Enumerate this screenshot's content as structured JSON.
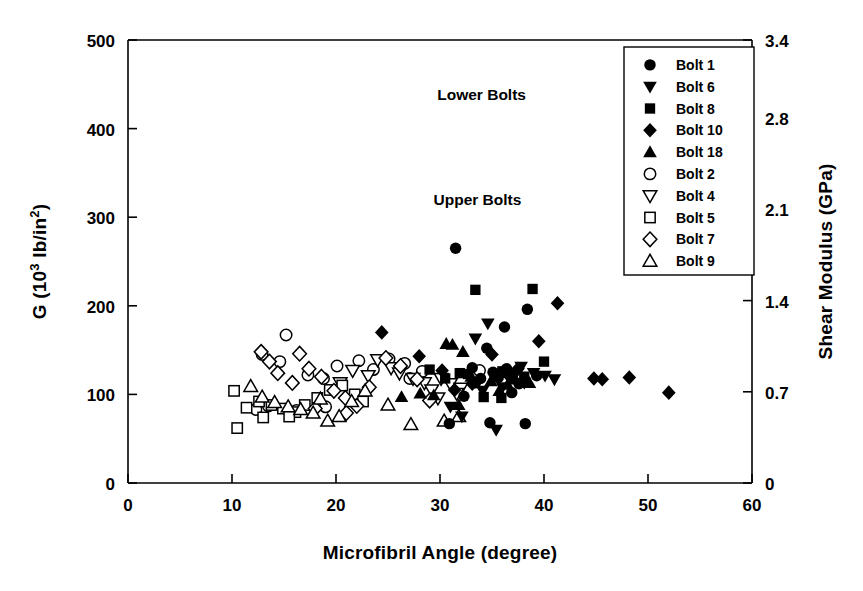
{
  "chart_data": {
    "type": "scatter",
    "title": "",
    "xlabel": "Microfibril Angle (degree)",
    "ylabel": "G (10³ lb/in²)",
    "y2label": "Shear Modulus (GPa)",
    "xlim": [
      0,
      60
    ],
    "ylim": [
      0,
      500
    ],
    "y2lim": [
      0,
      3.4
    ],
    "xticks": [
      "0",
      "10",
      "20",
      "30",
      "40",
      "50",
      "60"
    ],
    "xtick_values": [
      0,
      10,
      20,
      30,
      40,
      50,
      60
    ],
    "yticks": [
      "0",
      "100",
      "200",
      "300",
      "400",
      "500"
    ],
    "ytick_values": [
      0,
      100,
      200,
      300,
      400,
      500
    ],
    "y2ticks": [
      "0",
      "0.7",
      "1.4",
      "2.1",
      "2.8",
      "3.4"
    ],
    "y2tick_values": [
      0,
      0.7,
      1.4,
      2.1,
      2.8,
      3.4
    ],
    "grid": false,
    "legend_position": "top-right",
    "annotations": [
      {
        "text": "Lower Bolts",
        "x": 34.0,
        "y": 432
      },
      {
        "text": "Upper Bolts",
        "x": 33.6,
        "y": 314
      }
    ],
    "series": [
      {
        "name": "Bolt 1",
        "marker": "circle",
        "fill": "solid",
        "group": "Lower Bolts",
        "points": [
          [
            31.5,
            265
          ],
          [
            30.9,
            67
          ],
          [
            33.1,
            130
          ],
          [
            33.9,
            118
          ],
          [
            34.5,
            152
          ],
          [
            35.1,
            125
          ],
          [
            36.2,
            176
          ],
          [
            36.9,
            102
          ],
          [
            37.6,
            112
          ],
          [
            38.4,
            196
          ],
          [
            34.8,
            68
          ],
          [
            38.2,
            67
          ],
          [
            32.3,
            98
          ],
          [
            35.6,
            119
          ],
          [
            39.3,
            121
          ],
          [
            36.4,
            129
          ],
          [
            33.4,
            113
          ]
        ]
      },
      {
        "name": "Bolt 6",
        "marker": "triangle-down",
        "fill": "solid",
        "group": "Lower Bolts",
        "points": [
          [
            33.4,
            163
          ],
          [
            34.6,
            180
          ],
          [
            36.0,
            108
          ],
          [
            37.2,
            122
          ],
          [
            38.1,
            113
          ],
          [
            39.0,
            124
          ],
          [
            40.1,
            121
          ],
          [
            31.0,
            86
          ],
          [
            32.1,
            75
          ],
          [
            35.4,
            60
          ],
          [
            41.0,
            117
          ],
          [
            37.8,
            131
          ],
          [
            34.1,
            104
          ]
        ]
      },
      {
        "name": "Bolt 8",
        "marker": "square",
        "fill": "solid",
        "group": "Lower Bolts",
        "points": [
          [
            33.4,
            218
          ],
          [
            38.9,
            219
          ],
          [
            29.0,
            128
          ],
          [
            31.9,
            124
          ],
          [
            36.0,
            126
          ],
          [
            40.0,
            137
          ],
          [
            34.2,
            97
          ],
          [
            35.9,
            96
          ],
          [
            38.1,
            120
          ],
          [
            30.5,
            118
          ],
          [
            37.0,
            117
          ],
          [
            32.7,
            123
          ]
        ]
      },
      {
        "name": "Bolt 10",
        "marker": "diamond",
        "fill": "solid",
        "group": "Lower Bolts",
        "points": [
          [
            24.4,
            170
          ],
          [
            28.0,
            143
          ],
          [
            30.2,
            127
          ],
          [
            35.0,
            145
          ],
          [
            36.4,
            124
          ],
          [
            39.5,
            160
          ],
          [
            41.3,
            203
          ],
          [
            44.8,
            118
          ],
          [
            45.6,
            117
          ],
          [
            48.2,
            119
          ],
          [
            52.0,
            102
          ],
          [
            33.1,
            112
          ],
          [
            37.5,
            129
          ],
          [
            31.4,
            105
          ]
        ]
      },
      {
        "name": "Bolt 18",
        "marker": "triangle-up",
        "fill": "solid",
        "group": "Lower Bolts",
        "points": [
          [
            30.6,
            157
          ],
          [
            31.2,
            156
          ],
          [
            32.2,
            148
          ],
          [
            26.3,
            97
          ],
          [
            28.1,
            101
          ],
          [
            33.0,
            120
          ],
          [
            34.9,
            115
          ],
          [
            36.5,
            111
          ],
          [
            35.7,
            104
          ],
          [
            31.8,
            88
          ],
          [
            29.4,
            99
          ],
          [
            38.6,
            113
          ]
        ]
      },
      {
        "name": "Bolt 2",
        "marker": "circle",
        "fill": "open",
        "group": "Upper Bolts",
        "points": [
          [
            15.2,
            167
          ],
          [
            12.9,
            145
          ],
          [
            14.6,
            137
          ],
          [
            17.3,
            122
          ],
          [
            18.8,
            118
          ],
          [
            20.1,
            132
          ],
          [
            22.2,
            138
          ],
          [
            23.6,
            128
          ],
          [
            25.1,
            140
          ],
          [
            26.6,
            135
          ],
          [
            28.3,
            126
          ],
          [
            33.8,
            127
          ],
          [
            13.5,
            87
          ],
          [
            16.2,
            82
          ],
          [
            19.0,
            86
          ],
          [
            12.3,
            83
          ],
          [
            27.1,
            118
          ]
        ]
      },
      {
        "name": "Bolt 4",
        "marker": "triangle-down",
        "fill": "open",
        "group": "Upper Bolts",
        "points": [
          [
            24.0,
            139
          ],
          [
            25.3,
            130
          ],
          [
            26.1,
            124
          ],
          [
            27.4,
            118
          ],
          [
            28.5,
            113
          ],
          [
            29.2,
            105
          ],
          [
            30.1,
            118
          ],
          [
            31.0,
            112
          ],
          [
            23.1,
            121
          ],
          [
            21.6,
            127
          ],
          [
            32.0,
            107
          ],
          [
            20.4,
            113
          ],
          [
            29.8,
            96
          ],
          [
            31.6,
            101
          ]
        ]
      },
      {
        "name": "Bolt 5",
        "marker": "square",
        "fill": "open",
        "group": "Upper Bolts",
        "points": [
          [
            10.2,
            104
          ],
          [
            10.5,
            62
          ],
          [
            11.4,
            85
          ],
          [
            12.6,
            92
          ],
          [
            13.8,
            88
          ],
          [
            14.9,
            84
          ],
          [
            16.1,
            80
          ],
          [
            17.0,
            88
          ],
          [
            18.2,
            96
          ],
          [
            19.4,
            105
          ],
          [
            20.6,
            110
          ],
          [
            21.8,
            100
          ],
          [
            15.5,
            75
          ],
          [
            13.0,
            74
          ],
          [
            22.6,
            92
          ]
        ]
      },
      {
        "name": "Bolt 7",
        "marker": "diamond",
        "fill": "open",
        "group": "Upper Bolts",
        "points": [
          [
            12.8,
            148
          ],
          [
            13.6,
            137
          ],
          [
            14.4,
            124
          ],
          [
            16.5,
            146
          ],
          [
            17.4,
            129
          ],
          [
            18.6,
            120
          ],
          [
            15.8,
            113
          ],
          [
            19.8,
            104
          ],
          [
            20.9,
            96
          ],
          [
            22.0,
            87
          ],
          [
            23.2,
            108
          ],
          [
            24.8,
            141
          ],
          [
            26.2,
            132
          ],
          [
            18.0,
            84
          ],
          [
            21.0,
            79
          ],
          [
            27.8,
            117
          ],
          [
            29.0,
            93
          ]
        ]
      },
      {
        "name": "Bolt 9",
        "marker": "triangle-up",
        "fill": "open",
        "group": "Upper Bolts",
        "points": [
          [
            11.8,
            109
          ],
          [
            12.9,
            97
          ],
          [
            14.1,
            91
          ],
          [
            15.4,
            86
          ],
          [
            16.6,
            83
          ],
          [
            17.8,
            79
          ],
          [
            19.2,
            70
          ],
          [
            20.3,
            75
          ],
          [
            21.5,
            92
          ],
          [
            22.8,
            104
          ],
          [
            25.0,
            88
          ],
          [
            27.2,
            66
          ],
          [
            30.4,
            70
          ],
          [
            31.8,
            75
          ],
          [
            18.5,
            95
          ]
        ]
      }
    ]
  },
  "legend": {
    "items": [
      {
        "label": "Bolt 1",
        "marker": "circle",
        "fill": "solid"
      },
      {
        "label": "Bolt 6",
        "marker": "triangle-down",
        "fill": "solid"
      },
      {
        "label": "Bolt 8",
        "marker": "square",
        "fill": "solid"
      },
      {
        "label": "Bolt 10",
        "marker": "diamond",
        "fill": "solid"
      },
      {
        "label": "Bolt 18",
        "marker": "triangle-up",
        "fill": "solid"
      },
      {
        "label": "Bolt 2",
        "marker": "circle",
        "fill": "open"
      },
      {
        "label": "Bolt 4",
        "marker": "triangle-down",
        "fill": "open"
      },
      {
        "label": "Bolt 5",
        "marker": "square",
        "fill": "open"
      },
      {
        "label": "Bolt 7",
        "marker": "diamond",
        "fill": "open"
      },
      {
        "label": "Bolt 9",
        "marker": "triangle-up",
        "fill": "open"
      }
    ]
  },
  "colors": {
    "marker": "#000000",
    "axis": "#000000",
    "background": "#ffffff"
  }
}
